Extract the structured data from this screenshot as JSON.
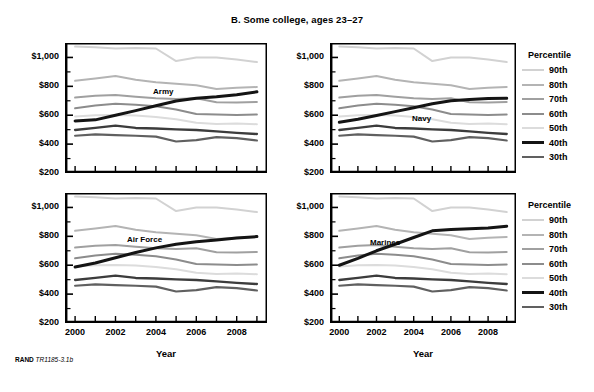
{
  "figure": {
    "title": "B. Some college, ages 23–27",
    "source_note_brand": "RAND",
    "source_note_id": "TR1185-3.1b"
  },
  "axes": {
    "ylabel": "",
    "xlabel": "Year",
    "ytick_labels": [
      "$1,000",
      "$800",
      "$600",
      "$400",
      "$200"
    ],
    "xtick_labels": [
      "2000",
      "2002",
      "2004",
      "2006",
      "2008"
    ]
  },
  "legend": {
    "title": "Percentile",
    "position": "right",
    "entries": [
      {
        "label": "90th",
        "color": "#d2d2d2",
        "width": 2.0
      },
      {
        "label": "80th",
        "color": "#b4b4b4",
        "width": 2.0
      },
      {
        "label": "70th",
        "color": "#a0a0a0",
        "width": 2.0
      },
      {
        "label": "60th",
        "color": "#8c8c8c",
        "width": 2.0
      },
      {
        "label": "50th",
        "color": "#dcdcdc",
        "width": 2.0
      },
      {
        "label": "40th",
        "color": "#141414",
        "width": 3.0
      },
      {
        "label": "30th",
        "color": "#606060",
        "width": 2.2
      }
    ]
  },
  "chart_data": {
    "type": "line",
    "title": "B. Some college, ages 23–27",
    "xlabel": "Year",
    "ylabel": "",
    "xlim": [
      1999.5,
      2009.5
    ],
    "ylim": [
      200,
      1100
    ],
    "grid": false,
    "legend_position": "right",
    "x": [
      2000,
      2001,
      2002,
      2003,
      2004,
      2005,
      2006,
      2007,
      2008,
      2009
    ],
    "panels": [
      {
        "name": "Army",
        "label": "Army",
        "series": [
          {
            "name": "90th",
            "color": "#d2d2d2",
            "width": 2.0,
            "values": [
              1075,
              1070,
              1062,
              1065,
              1062,
              975,
              1000,
              1000,
              985,
              968
            ]
          },
          {
            "name": "80th",
            "color": "#b4b4b4",
            "width": 2.0,
            "values": [
              838,
              855,
              872,
              845,
              828,
              818,
              808,
              782,
              790,
              795
            ]
          },
          {
            "name": "70th",
            "color": "#a0a0a0",
            "width": 2.0,
            "values": [
              722,
              735,
              740,
              728,
              718,
              712,
              718,
              690,
              688,
              692
            ]
          },
          {
            "name": "60th",
            "color": "#8c8c8c",
            "width": 2.0,
            "values": [
              648,
              668,
              680,
              672,
              662,
              640,
              608,
              605,
              602,
              605
            ]
          },
          {
            "name": "50th",
            "color": "#dcdcdc",
            "width": 2.0,
            "values": [
              592,
              600,
              602,
              598,
              588,
              572,
              548,
              540,
              542,
              538
            ]
          },
          {
            "name": "40th",
            "color": "#141414",
            "width": 3.0,
            "values": [
              560,
              568,
              600,
              632,
              665,
              698,
              718,
              728,
              742,
              762
            ]
          },
          {
            "name": "30th",
            "color": "#606060",
            "width": 2.2,
            "values": [
              458,
              468,
              462,
              458,
              452,
              418,
              428,
              448,
              442,
              425
            ]
          }
        ],
        "bold_series": "40th",
        "extra_series": {
          "name": "mid-dark",
          "color": "#3c3c3c",
          "width": 2.4,
          "values": [
            498,
            512,
            528,
            512,
            508,
            502,
            498,
            488,
            478,
            470
          ]
        }
      },
      {
        "name": "Navy",
        "label": "Navy",
        "series": [
          {
            "name": "90th",
            "color": "#d2d2d2",
            "width": 2.0,
            "values": [
              1075,
              1070,
              1062,
              1065,
              1062,
              975,
              1000,
              1000,
              985,
              968
            ]
          },
          {
            "name": "80th",
            "color": "#b4b4b4",
            "width": 2.0,
            "values": [
              838,
              855,
              872,
              845,
              828,
              818,
              808,
              782,
              790,
              795
            ]
          },
          {
            "name": "70th",
            "color": "#a0a0a0",
            "width": 2.0,
            "values": [
              722,
              735,
              740,
              728,
              718,
              712,
              718,
              690,
              688,
              692
            ]
          },
          {
            "name": "60th",
            "color": "#8c8c8c",
            "width": 2.0,
            "values": [
              648,
              668,
              680,
              672,
              662,
              640,
              608,
              605,
              602,
              605
            ]
          },
          {
            "name": "50th",
            "color": "#dcdcdc",
            "width": 2.0,
            "values": [
              592,
              600,
              602,
              598,
              588,
              572,
              548,
              540,
              542,
              538
            ]
          },
          {
            "name": "40th",
            "color": "#141414",
            "width": 3.0,
            "values": [
              552,
              572,
              598,
              625,
              652,
              680,
              700,
              708,
              715,
              718
            ]
          },
          {
            "name": "30th",
            "color": "#606060",
            "width": 2.2,
            "values": [
              458,
              468,
              462,
              458,
              452,
              418,
              428,
              448,
              442,
              425
            ]
          }
        ],
        "bold_series": "40th",
        "extra_series": {
          "name": "mid-dark",
          "color": "#3c3c3c",
          "width": 2.4,
          "values": [
            498,
            512,
            528,
            512,
            508,
            502,
            498,
            488,
            478,
            470
          ]
        }
      },
      {
        "name": "Air Force",
        "label": "Air Force",
        "series": [
          {
            "name": "90th",
            "color": "#d2d2d2",
            "width": 2.0,
            "values": [
              1075,
              1070,
              1062,
              1065,
              1062,
              975,
              1000,
              1000,
              985,
              968
            ]
          },
          {
            "name": "80th",
            "color": "#b4b4b4",
            "width": 2.0,
            "values": [
              838,
              855,
              872,
              845,
              828,
              818,
              808,
              782,
              790,
              795
            ]
          },
          {
            "name": "70th",
            "color": "#a0a0a0",
            "width": 2.0,
            "values": [
              722,
              735,
              740,
              728,
              718,
              712,
              718,
              690,
              688,
              692
            ]
          },
          {
            "name": "60th",
            "color": "#8c8c8c",
            "width": 2.0,
            "values": [
              648,
              668,
              680,
              672,
              662,
              640,
              608,
              605,
              602,
              605
            ]
          },
          {
            "name": "50th",
            "color": "#dcdcdc",
            "width": 2.0,
            "values": [
              592,
              600,
              602,
              598,
              588,
              572,
              548,
              540,
              542,
              538
            ]
          },
          {
            "name": "40th",
            "color": "#141414",
            "width": 3.0,
            "values": [
              588,
              615,
              652,
              688,
              720,
              745,
              762,
              775,
              788,
              798
            ]
          },
          {
            "name": "30th",
            "color": "#606060",
            "width": 2.2,
            "values": [
              458,
              468,
              462,
              458,
              452,
              418,
              428,
              448,
              442,
              425
            ]
          }
        ],
        "bold_series": "40th",
        "extra_series": {
          "name": "mid-dark",
          "color": "#3c3c3c",
          "width": 2.4,
          "values": [
            498,
            512,
            528,
            512,
            508,
            502,
            498,
            488,
            478,
            470
          ]
        }
      },
      {
        "name": "Marines",
        "label": "Marines",
        "series": [
          {
            "name": "90th",
            "color": "#d2d2d2",
            "width": 2.0,
            "values": [
              1075,
              1070,
              1062,
              1065,
              1062,
              975,
              1000,
              1000,
              985,
              968
            ]
          },
          {
            "name": "80th",
            "color": "#b4b4b4",
            "width": 2.0,
            "values": [
              838,
              855,
              872,
              845,
              828,
              818,
              808,
              782,
              790,
              795
            ]
          },
          {
            "name": "70th",
            "color": "#a0a0a0",
            "width": 2.0,
            "values": [
              722,
              735,
              740,
              728,
              718,
              712,
              718,
              690,
              688,
              692
            ]
          },
          {
            "name": "60th",
            "color": "#8c8c8c",
            "width": 2.0,
            "values": [
              648,
              668,
              680,
              672,
              662,
              640,
              608,
              605,
              602,
              605
            ]
          },
          {
            "name": "50th",
            "color": "#dcdcdc",
            "width": 2.0,
            "values": [
              592,
              600,
              602,
              598,
              588,
              572,
              548,
              540,
              542,
              538
            ]
          },
          {
            "name": "40th",
            "color": "#141414",
            "width": 3.0,
            "values": [
              600,
              648,
              700,
              745,
              792,
              838,
              848,
              852,
              858,
              870
            ]
          },
          {
            "name": "30th",
            "color": "#606060",
            "width": 2.2,
            "values": [
              458,
              468,
              462,
              458,
              452,
              418,
              428,
              448,
              442,
              425
            ]
          }
        ],
        "bold_series": "40th",
        "extra_series": {
          "name": "mid-dark",
          "color": "#3c3c3c",
          "width": 2.4,
          "values": [
            498,
            512,
            528,
            512,
            508,
            502,
            498,
            488,
            478,
            470
          ]
        }
      }
    ]
  },
  "panel_layout": [
    {
      "key": "army",
      "left": 65,
      "top": 43,
      "width": 202,
      "height": 130,
      "show_xticklabels": false,
      "label_x": 88,
      "label_y": 44
    },
    {
      "key": "navy",
      "left": 330,
      "top": 43,
      "width": 186,
      "height": 130,
      "show_xticklabels": false,
      "label_x": 82,
      "label_y": 71
    },
    {
      "key": "airforce",
      "left": 65,
      "top": 193,
      "width": 202,
      "height": 130,
      "show_xticklabels": true,
      "label_x": 62,
      "label_y": 42
    },
    {
      "key": "marines",
      "left": 330,
      "top": 193,
      "width": 186,
      "height": 130,
      "show_xticklabels": true,
      "label_x": 40,
      "label_y": 45
    }
  ]
}
